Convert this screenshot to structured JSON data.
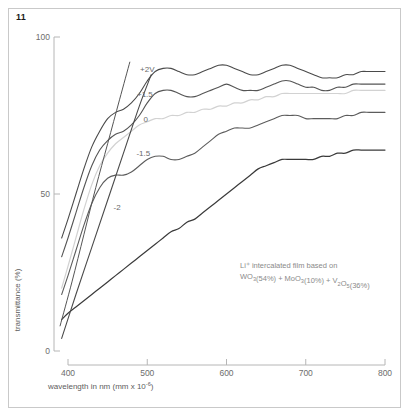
{
  "figure": {
    "number": "11"
  },
  "chart_data": {
    "type": "line",
    "title": "",
    "xlabel": "wavelength in nm (mm x 10",
    "xlabel_exponent": "-6",
    "xlabel_tail": ")",
    "ylabel": "transmittance (%)",
    "xlim": [
      380,
      800
    ],
    "ylim": [
      0,
      100
    ],
    "grid": false,
    "legend_position": "inline-labels",
    "xticks": [
      "400",
      "500",
      "600",
      "700",
      "800"
    ],
    "xtick_values": [
      400,
      500,
      600,
      700,
      800
    ],
    "yticks": [
      "0",
      "50",
      "100"
    ],
    "ytick_values": [
      0,
      50,
      100
    ],
    "annotation": {
      "line1": "Li⁺ intercalated film based on",
      "line2_parts": [
        {
          "t": "WO",
          "sub": "3"
        },
        {
          "t": "(54%) + MoO",
          "sub": "3"
        },
        {
          "t": "(10%) + V",
          "sub": "2"
        },
        {
          "t": "O",
          "sub": "5"
        },
        {
          "t": "(36%)",
          "sub": ""
        }
      ]
    },
    "series": [
      {
        "name": "+2V",
        "label": "+2V",
        "color": "#4a4a4a",
        "width": 1.1,
        "label_x": 500,
        "label_y": 89,
        "x": [
          392,
          400,
          410,
          420,
          430,
          440,
          450,
          460,
          470,
          480,
          490,
          500,
          510,
          520,
          530,
          540,
          550,
          560,
          570,
          580,
          590,
          600,
          610,
          620,
          630,
          640,
          650,
          660,
          670,
          680,
          690,
          700,
          710,
          720,
          730,
          740,
          750,
          760,
          770,
          780,
          790,
          800
        ],
        "y": [
          36,
          42,
          50,
          58,
          65,
          70,
          74,
          76,
          77,
          79,
          82,
          86,
          89,
          90,
          90,
          89,
          88,
          88,
          89,
          90,
          91,
          91,
          90,
          89,
          88,
          88,
          89,
          90,
          91,
          91,
          90,
          89,
          88,
          87,
          87,
          87,
          88,
          88,
          89,
          89,
          89,
          89
        ]
      },
      {
        "name": "+1.5",
        "label": "+1.5",
        "color": "#555555",
        "width": 1.1,
        "label_x": 497,
        "label_y": 81,
        "x": [
          392,
          400,
          410,
          420,
          430,
          440,
          450,
          460,
          470,
          480,
          490,
          500,
          510,
          520,
          530,
          540,
          550,
          560,
          570,
          580,
          590,
          600,
          610,
          620,
          630,
          640,
          650,
          660,
          670,
          680,
          690,
          700,
          710,
          720,
          730,
          740,
          750,
          760,
          770,
          780,
          790,
          800
        ],
        "y": [
          30,
          36,
          44,
          52,
          59,
          64,
          67,
          69,
          70,
          72,
          75,
          79,
          82,
          83,
          83,
          82,
          81,
          81,
          82,
          83,
          84,
          85,
          84,
          83,
          83,
          83,
          84,
          85,
          86,
          86,
          85,
          84,
          84,
          83,
          83,
          84,
          84,
          85,
          85,
          85,
          85,
          85
        ]
      },
      {
        "name": "0",
        "label": "0",
        "color": "#d2d2d2",
        "width": 1.2,
        "label_x": 498,
        "label_y": 73,
        "x": [
          392,
          400,
          410,
          420,
          430,
          440,
          450,
          460,
          470,
          480,
          490,
          500,
          510,
          520,
          530,
          540,
          550,
          560,
          570,
          580,
          590,
          600,
          610,
          620,
          630,
          640,
          650,
          660,
          670,
          680,
          690,
          700,
          710,
          720,
          730,
          740,
          750,
          760,
          770,
          780,
          790,
          800
        ],
        "y": [
          20,
          27,
          36,
          45,
          53,
          59,
          63,
          66,
          68,
          70,
          72,
          73,
          74,
          74,
          75,
          75,
          76,
          76,
          77,
          77,
          78,
          78,
          79,
          79,
          80,
          80,
          81,
          81,
          82,
          82,
          82,
          82,
          82,
          82,
          82,
          82,
          82,
          83,
          83,
          83,
          83,
          83
        ]
      },
      {
        "name": "-1.5",
        "label": "-1.5",
        "color": "#5c5c5c",
        "width": 1.1,
        "label_x": 495,
        "label_y": 62,
        "x": [
          392,
          400,
          410,
          420,
          430,
          440,
          450,
          460,
          470,
          480,
          490,
          500,
          510,
          520,
          530,
          540,
          550,
          560,
          570,
          580,
          590,
          600,
          610,
          620,
          630,
          640,
          650,
          660,
          670,
          680,
          690,
          700,
          710,
          720,
          730,
          740,
          750,
          760,
          770,
          780,
          790,
          800
        ],
        "y": [
          18,
          24,
          32,
          40,
          47,
          52,
          55,
          56,
          56,
          57,
          59,
          61,
          62,
          62,
          61,
          61,
          62,
          63,
          65,
          67,
          69,
          70,
          71,
          71,
          71,
          72,
          73,
          74,
          75,
          75,
          75,
          74,
          74,
          74,
          74,
          74,
          75,
          75,
          76,
          76,
          76,
          76
        ]
      },
      {
        "name": "-2",
        "label": "-2",
        "color": "#3a3a3a",
        "width": 1.2,
        "label_x": 462,
        "label_y": 45,
        "x": [
          392,
          400,
          410,
          420,
          430,
          440,
          450,
          460,
          470,
          480,
          490,
          500,
          510,
          520,
          530,
          540,
          550,
          560,
          570,
          580,
          590,
          600,
          610,
          620,
          630,
          640,
          650,
          660,
          670,
          680,
          690,
          700,
          710,
          720,
          730,
          740,
          750,
          760,
          770,
          780,
          790,
          800
        ],
        "y": [
          10,
          12,
          14,
          16,
          18,
          20,
          22,
          24,
          26,
          28,
          30,
          32,
          34,
          36,
          38,
          39,
          41,
          42,
          44,
          46,
          48,
          50,
          52,
          54,
          56,
          58,
          59,
          60,
          61,
          61,
          61,
          61,
          61,
          62,
          62,
          63,
          63,
          64,
          64,
          64,
          64,
          64
        ]
      },
      {
        "name": "rising-line-a",
        "label": "",
        "color": "#4a4a4a",
        "width": 1.1,
        "label_x": 0,
        "label_y": 0,
        "x": [
          392,
          410,
          430,
          450,
          470,
          490,
          505
        ],
        "y": [
          4,
          18,
          33,
          48,
          63,
          78,
          88
        ]
      },
      {
        "name": "rising-line-b",
        "label": "",
        "color": "#555555",
        "width": 1.0,
        "label_x": 0,
        "label_y": 0,
        "x": [
          390,
          405,
          420,
          435,
          450,
          465,
          478
        ],
        "y": [
          8,
          22,
          37,
          52,
          66,
          80,
          92
        ]
      }
    ]
  }
}
